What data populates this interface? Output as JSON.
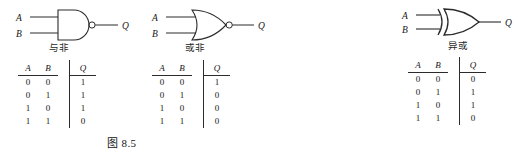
{
  "figures": [
    {
      "id": "8.5",
      "caption_prefix": "图",
      "caption_number": "8.5",
      "gates": [
        {
          "key": "nand",
          "type": "NAND",
          "label": "与非",
          "inputs": [
            "A",
            "B"
          ],
          "output": "Q",
          "has_bubble": true,
          "truth_table": {
            "headers": [
              "A",
              "B",
              "Q"
            ],
            "rows": [
              [
                "0",
                "0",
                "1"
              ],
              [
                "0",
                "1",
                "1"
              ],
              [
                "1",
                "0",
                "1"
              ],
              [
                "1",
                "1",
                "0"
              ]
            ]
          }
        },
        {
          "key": "nor",
          "type": "NOR",
          "label": "或非",
          "inputs": [
            "A",
            "B"
          ],
          "output": "Q",
          "has_bubble": true,
          "truth_table": {
            "headers": [
              "A",
              "B",
              "Q"
            ],
            "rows": [
              [
                "0",
                "0",
                "1"
              ],
              [
                "0",
                "1",
                "0"
              ],
              [
                "1",
                "0",
                "0"
              ],
              [
                "1",
                "1",
                "0"
              ]
            ]
          }
        }
      ]
    },
    {
      "id": "8.6",
      "caption_prefix": "图",
      "caption_number": "8.6",
      "gates": [
        {
          "key": "xor",
          "type": "XOR",
          "label": "异或",
          "inputs": [
            "A",
            "B"
          ],
          "output": "Q",
          "has_bubble": false,
          "truth_table": {
            "headers": [
              "A",
              "B",
              "Q"
            ],
            "rows": [
              [
                "0",
                "0",
                "0"
              ],
              [
                "0",
                "1",
                "1"
              ],
              [
                "1",
                "0",
                "1"
              ],
              [
                "1",
                "1",
                "0"
              ]
            ]
          }
        }
      ]
    }
  ],
  "colors": {
    "ink": "#1a1a1a",
    "line": "#2b2b2b",
    "background": "#ffffff"
  }
}
